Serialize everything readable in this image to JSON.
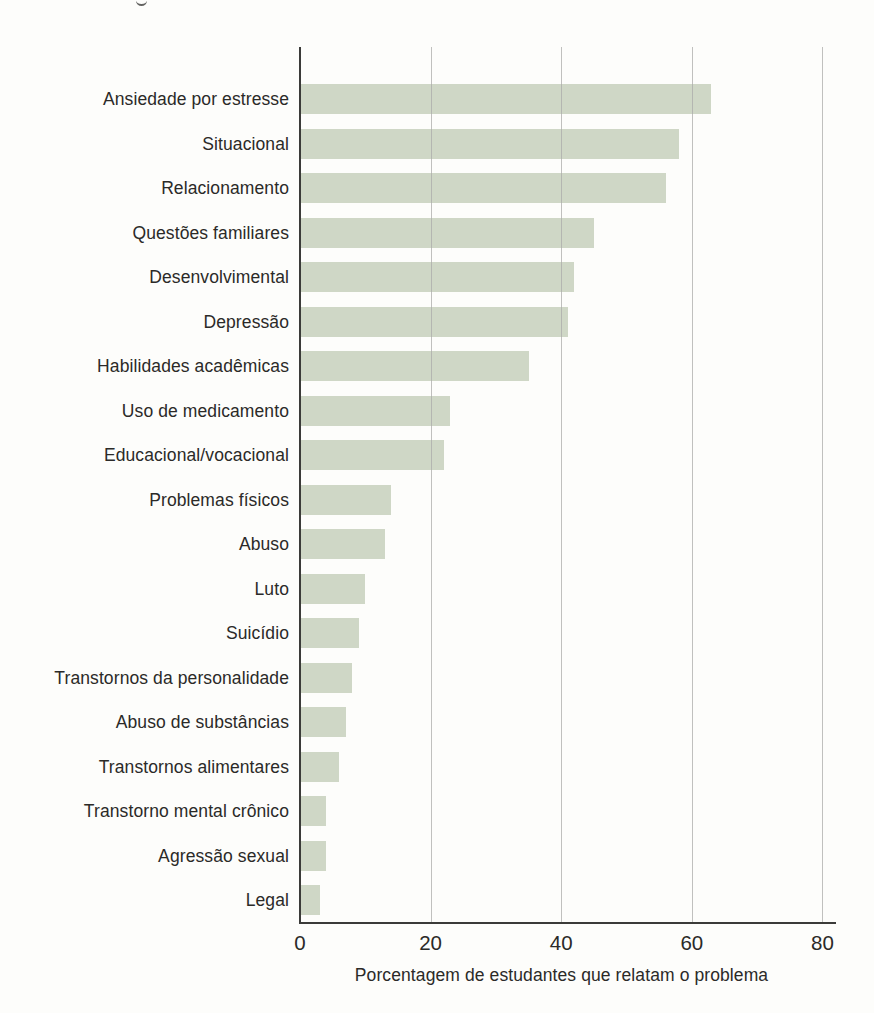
{
  "chart_data": {
    "type": "bar",
    "orientation": "horizontal",
    "title": "",
    "xlabel": "Porcentagem de estudantes que relatam o problema",
    "ylabel": "",
    "xlim": [
      0,
      80
    ],
    "x_ticks": [
      0,
      20,
      40,
      60,
      80
    ],
    "grid": "vertical gridlines at x ticks, drawn over bars",
    "legend": "none",
    "categories": [
      "Ansiedade por estresse",
      "Situacional",
      "Relacionamento",
      "Questões familiares",
      "Desenvolvimental",
      "Depressão",
      "Habilidades acadêmicas",
      "Uso de medicamento",
      "Educacional/vocacional",
      "Problemas físicos",
      "Abuso",
      "Luto",
      "Suicídio",
      "Transtornos da personalidade",
      "Abuso de substâncias",
      "Transtornos alimentares",
      "Transtorno mental crônico",
      "Agressão sexual",
      "Legal"
    ],
    "values": [
      63,
      58,
      56,
      45,
      42,
      41,
      35,
      23,
      22,
      14,
      13,
      10,
      9,
      8,
      7,
      6,
      4,
      4,
      3
    ]
  },
  "colors": {
    "bar_fill": "#cfd7c6",
    "gridline": "#ababa9",
    "axis": "#3b3b39",
    "text": "#2b2a28",
    "paper": "#fdfdfb"
  }
}
